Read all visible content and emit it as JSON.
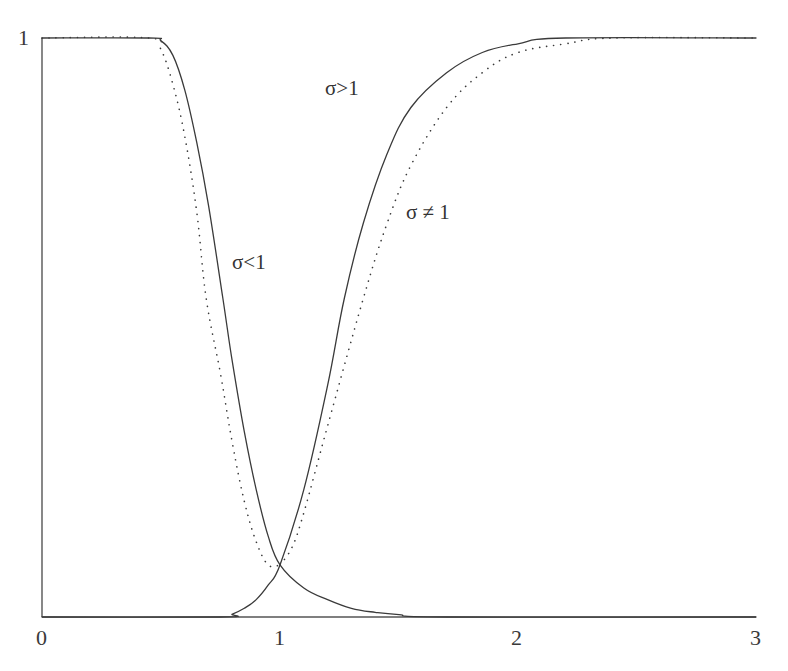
{
  "chart_data": {
    "type": "line",
    "title": "",
    "xlabel": "",
    "ylabel": "",
    "xlim": [
      0,
      3
    ],
    "ylim": [
      0,
      1
    ],
    "grid": false,
    "legend": "none (inline annotations)",
    "x_ticks": [
      "0",
      "1",
      "2",
      "3"
    ],
    "y_ticks": [
      "1"
    ],
    "series": [
      {
        "name": "decreasing (solid)",
        "style": "solid",
        "x": [
          0,
          0.45,
          0.5,
          0.55,
          0.6,
          0.65,
          0.7,
          0.76,
          0.8,
          0.85,
          0.9,
          0.95,
          1.0,
          1.1,
          1.2,
          1.3,
          1.4,
          1.5,
          1.7,
          3.0
        ],
        "y": [
          1,
          1,
          0.995,
          0.97,
          0.91,
          0.82,
          0.71,
          0.55,
          0.44,
          0.32,
          0.22,
          0.14,
          0.09,
          0.05,
          0.03,
          0.015,
          0.008,
          0.004,
          0.0,
          0.0
        ]
      },
      {
        "name": "decreasing (dotted)",
        "style": "dotted",
        "x": [
          0,
          0.45,
          0.5,
          0.55,
          0.6,
          0.65,
          0.69,
          0.75,
          0.8,
          0.85,
          0.9,
          0.95,
          1.0
        ],
        "y": [
          1,
          1,
          0.98,
          0.92,
          0.83,
          0.7,
          0.55,
          0.42,
          0.3,
          0.2,
          0.13,
          0.09,
          0.09
        ]
      },
      {
        "name": "increasing (solid)",
        "style": "solid",
        "x": [
          0,
          0.75,
          0.8,
          0.85,
          0.9,
          0.95,
          1.0,
          1.1,
          1.2,
          1.27,
          1.35,
          1.45,
          1.55,
          1.7,
          1.85,
          2.0,
          2.2,
          3.0
        ],
        "y": [
          0,
          0,
          0.005,
          0.015,
          0.03,
          0.055,
          0.09,
          0.22,
          0.4,
          0.55,
          0.68,
          0.8,
          0.88,
          0.94,
          0.975,
          0.99,
          1.0,
          1.0
        ]
      },
      {
        "name": "increasing (dotted)",
        "style": "dotted",
        "x": [
          1.0,
          1.05,
          1.1,
          1.2,
          1.35,
          1.45,
          1.55,
          1.7,
          1.85,
          2.0,
          2.2,
          2.4,
          3.0
        ],
        "y": [
          0.09,
          0.12,
          0.18,
          0.33,
          0.55,
          0.68,
          0.78,
          0.88,
          0.94,
          0.975,
          0.99,
          1.0,
          1.0
        ]
      }
    ],
    "annotations": [
      {
        "text": "σ>1",
        "x": 1.28,
        "y": 0.92
      },
      {
        "text": "σ≠1",
        "x": 1.67,
        "y": 0.74
      },
      {
        "text": "σ<1",
        "x": 0.85,
        "y": 0.55
      }
    ]
  },
  "axes": {
    "x_tick_labels": [
      "0",
      "1",
      "2",
      "3"
    ],
    "y_tick_label_top": "1"
  },
  "labels": {
    "sigma_gt_1": "σ>1",
    "sigma_ne_1": "σ ≠ 1",
    "sigma_lt_1": "σ<1"
  },
  "colors": {
    "line": "#3a3a3a",
    "background": "#ffffff"
  }
}
